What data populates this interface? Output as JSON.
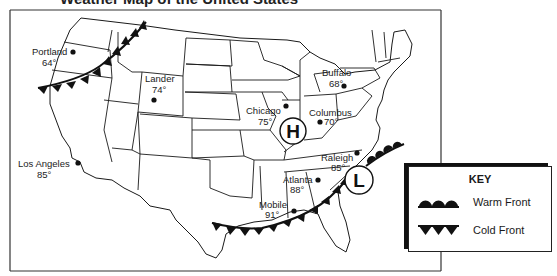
{
  "title": "Weather Map of the United States",
  "map": {
    "cities": [
      {
        "name": "Portland",
        "temp": "64°"
      },
      {
        "name": "Lander",
        "temp": "74°"
      },
      {
        "name": "Los Angeles",
        "temp": "85°"
      },
      {
        "name": "Chicago",
        "temp": "75°"
      },
      {
        "name": "Buffalo",
        "temp": "68°"
      },
      {
        "name": "Columbus",
        "temp": "70°"
      },
      {
        "name": "Raleigh",
        "temp": "85°"
      },
      {
        "name": "Atlanta",
        "temp": "88°"
      },
      {
        "name": "Mobile",
        "temp": "91°"
      }
    ],
    "pressure_systems": [
      {
        "type": "high",
        "symbol": "H"
      },
      {
        "type": "low",
        "symbol": "L"
      }
    ],
    "fronts": [
      {
        "type": "cold",
        "location": "Northwest (Oregon coast to Montana)"
      },
      {
        "type": "cold",
        "location": "Gulf Coast (Texas to Georgia/South Carolina)"
      },
      {
        "type": "warm",
        "location": "Mid-Atlantic coast (North Carolina northeast)"
      }
    ]
  },
  "key": {
    "title": "KEY",
    "items": [
      {
        "symbol": "warm-front",
        "label": "Warm Front"
      },
      {
        "symbol": "cold-front",
        "label": "Cold Front"
      }
    ]
  },
  "colors": {
    "line": "#1a1a1a",
    "background": "#ffffff"
  }
}
